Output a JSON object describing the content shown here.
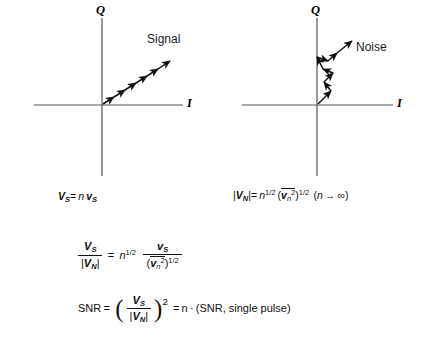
{
  "figure": {
    "type": "iq-phasor-diagram-pair",
    "panels": [
      {
        "id": "signal",
        "axis_x_label": "I",
        "axis_y_label": "Q",
        "curve_label": "Signal",
        "caption_parts": {
          "lhs_V": "V",
          "lhs_sub": "S",
          "equals": "=",
          "n": "n",
          "rhs_v": "v",
          "rhs_sub": "S"
        },
        "caption_plain": "VS = n vS",
        "description": "chain of six collinear arrows along a 33 degree ray from the origin, coherent addition"
      },
      {
        "id": "noise",
        "axis_x_label": "I",
        "axis_y_label": "Q",
        "curve_label": "Noise",
        "caption_plain": "|VN| = n^1/2 (vn^2 bar)^1/2 (n -> infinity)",
        "caption_parts": {
          "abs_open": "|",
          "V": "V",
          "V_sub": "N",
          "abs_close": "|",
          "equals": "=",
          "n": "n",
          "n_exp": "1/2",
          "paren_open": "(",
          "v": "v",
          "v_sub": "n",
          "v_sup": "2",
          "paren_close": ")",
          "outer_exp": "1/2",
          "limit_open": "(",
          "limit_n": "n",
          "limit_arrow": "→",
          "limit_inf": "∞",
          "limit_close": ")"
        },
        "description": "random-walk zigzag of eight segments rising from the origin, incoherent addition"
      }
    ],
    "equations": [
      {
        "id": "ratio",
        "plain": "VS / |VN| = n^1/2 * vS / (vn^2 bar)^1/2",
        "parts": {
          "num_V": "V",
          "num_sub": "S",
          "den_abs_open": "|",
          "den_V": "V",
          "den_sub": "N",
          "den_abs_close": "|",
          "equals": "=",
          "n": "n",
          "n_exp": "1/2",
          "rhs_num_v": "v",
          "rhs_num_sub": "S",
          "rhs_den_open": "(",
          "rhs_den_v": "v",
          "rhs_den_sub": "n",
          "rhs_den_sup": "2",
          "rhs_den_close": ")",
          "rhs_den_exp": "1/2"
        }
      },
      {
        "id": "snr",
        "plain": "SNR = ( VS / |VN| )^2 = n . (SNR, single pulse)",
        "parts": {
          "snr": "SNR",
          "eq1": "=",
          "paren_open": "(",
          "num_V": "V",
          "num_sub": "S",
          "den_abs_open": "|",
          "den_V": "V",
          "den_sub": "N",
          "den_abs_close": "|",
          "paren_close": ")",
          "power": "2",
          "eq2": "=",
          "n": "n",
          "dot": "·",
          "tail": "(SNR, single pulse)"
        }
      }
    ],
    "colors": {
      "axis": "#555555",
      "vector": "#111111",
      "text": "#111111",
      "background": "#ffffff"
    }
  }
}
